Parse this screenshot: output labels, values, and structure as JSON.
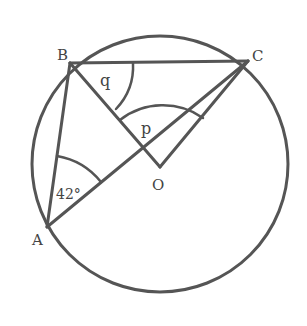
{
  "diagram": {
    "circle": {
      "cx": 160,
      "cy": 164,
      "r": 128
    },
    "points": {
      "A": {
        "x": 47,
        "y": 227,
        "label": "A",
        "lx": 34,
        "ly": 242
      },
      "B": {
        "x": 70,
        "y": 63,
        "label": "B",
        "lx": 57,
        "ly": 61
      },
      "C": {
        "x": 248,
        "y": 61,
        "label": "C",
        "lx": 252,
        "ly": 61
      },
      "O": {
        "x": 160,
        "y": 167,
        "label": "O",
        "lx": 152,
        "ly": 190
      }
    },
    "angle_labels": {
      "q": {
        "text": "q",
        "x": 100,
        "y": 86
      },
      "p": {
        "text": "p",
        "x": 141,
        "y": 134
      },
      "a42": {
        "text": "42°",
        "x": 56,
        "y": 199
      }
    },
    "stroke_color": "#555555",
    "label_color": "#444444"
  }
}
